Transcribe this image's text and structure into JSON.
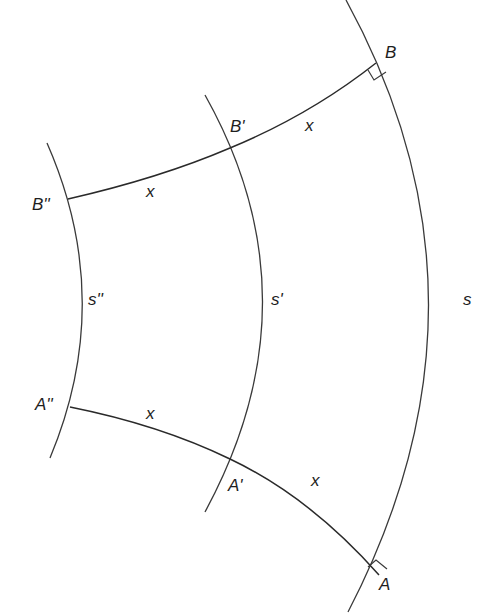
{
  "diagram": {
    "type": "geodesic-curvature-figure",
    "curves": [
      {
        "id": "s",
        "label": "s",
        "role": "outer curve"
      },
      {
        "id": "s1",
        "label": "s'",
        "role": "middle curve"
      },
      {
        "id": "s2",
        "label": "s''",
        "role": "inner curve"
      }
    ],
    "points": {
      "B": "B",
      "B1": "B'",
      "B2": "B''",
      "A": "A",
      "A1": "A'",
      "A2": "A''"
    },
    "segment_labels": {
      "top_right": "x",
      "top_left": "x",
      "bottom_left": "x",
      "bottom_right": "x"
    },
    "right_angles": [
      "at B",
      "at A"
    ],
    "colors": {
      "stroke": "#3a3a3a",
      "text": "#1e1e1e",
      "background": "#ffffff"
    }
  }
}
